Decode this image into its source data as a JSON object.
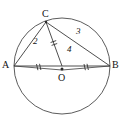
{
  "figure": {
    "type": "circle-geometry-diagram",
    "stroke_color": "#3a3a3a",
    "label_color": "#111111",
    "background_color": "#ffffff",
    "circle": {
      "center_label": "O",
      "center_x": 62,
      "center_y": 66,
      "radius": 48
    },
    "points": [
      {
        "id": "A",
        "label": "A",
        "x": 14,
        "y": 66,
        "label_x": 2,
        "label_y": 61
      },
      {
        "id": "B",
        "label": "B",
        "x": 110,
        "y": 66,
        "label_x": 112,
        "label_y": 61
      },
      {
        "id": "C",
        "label": "C",
        "x": 46,
        "y": 22,
        "label_x": 42,
        "label_y": 10
      },
      {
        "id": "O",
        "label": "O",
        "x": 62,
        "y": 66,
        "label_x": 58,
        "label_y": 73
      }
    ],
    "segments": [
      {
        "id": "CA",
        "from": "C",
        "to": "A",
        "length_label": "2",
        "label_x": 33,
        "label_y": 38
      },
      {
        "id": "CB",
        "from": "C",
        "to": "B",
        "length_label": "3",
        "label_x": 76,
        "label_y": 27
      },
      {
        "id": "AB",
        "from": "A",
        "to": "B",
        "length_label": "4",
        "label_x": 67,
        "label_y": 46
      },
      {
        "id": "CO",
        "from": "C",
        "to": "O",
        "length_label": "",
        "label_x": 0,
        "label_y": 0
      }
    ],
    "tick_marks": [
      {
        "id": "tick-AO",
        "on_segment": "AO",
        "count": 2,
        "x": 38,
        "y": 64
      },
      {
        "id": "tick-OB",
        "on_segment": "OB",
        "count": 2,
        "x": 86,
        "y": 64
      },
      {
        "id": "tick-CO",
        "on_segment": "CO",
        "count": 2,
        "x": 54,
        "y": 44
      }
    ],
    "labels": {
      "A": "A",
      "B": "B",
      "C": "C",
      "O": "O",
      "len_CA": "2",
      "len_CB": "3",
      "len_AB": "4"
    }
  }
}
